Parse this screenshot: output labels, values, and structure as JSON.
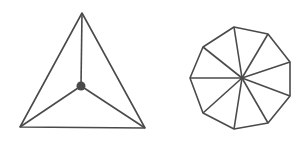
{
  "figures": [
    {
      "name": "triangle-with-center-point",
      "outer_vertices": [
        [
          82,
          13
        ],
        [
          20,
          127
        ],
        [
          145,
          128
        ]
      ],
      "center": [
        81,
        86
      ],
      "center_dot_radius": 4.5,
      "color": "#4a4a4a"
    },
    {
      "name": "nonagon-with-spokes",
      "outer_vertices": [
        [
          234,
          27
        ],
        [
          268,
          34
        ],
        [
          290,
          62
        ],
        [
          290,
          96
        ],
        [
          268,
          123
        ],
        [
          234,
          129
        ],
        [
          203,
          113
        ],
        [
          190,
          78
        ],
        [
          203,
          47
        ]
      ],
      "center": [
        242,
        78
      ],
      "center_dot_radius": 2,
      "color": "#4a4a4a"
    }
  ],
  "stroke_width": 1.6
}
